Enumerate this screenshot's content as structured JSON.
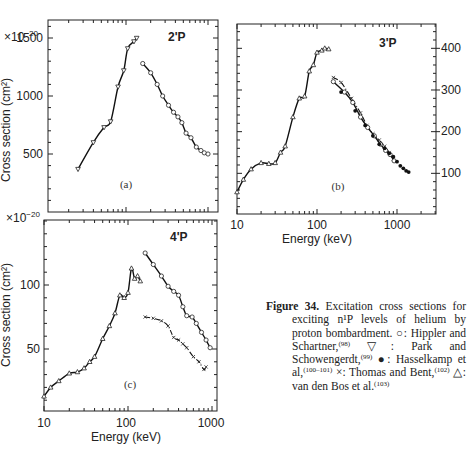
{
  "figure": {
    "caption_label": "Figure 34.",
    "caption_text": "Excitation cross sections for exciting n¹P levels of helium by proton bombardment.",
    "legend": [
      {
        "symbol": "○",
        "name": "open-circle",
        "text": "Hippler and Schartner,",
        "ref": "(98)"
      },
      {
        "symbol": "▽",
        "name": "down-triangle",
        "text": "Park and Schowengerdt,",
        "ref": "(99)"
      },
      {
        "symbol": "●",
        "name": "filled-circle",
        "text": "Hasselkamp et al,",
        "ref": "(100–101)"
      },
      {
        "symbol": "×",
        "name": "cross",
        "text": "Thomas and Bent,",
        "ref": "(102)"
      },
      {
        "symbol": "△",
        "name": "up-triangle",
        "text": "van den Bos et al.",
        "ref": "(103)"
      }
    ]
  },
  "chart_data": [
    {
      "type": "line",
      "panel": "(a)",
      "title": "2¹P",
      "xlabel": "",
      "ylabel": "Cross section (cm²)",
      "y_multiplier": "×10⁻²⁰",
      "xscale": "log",
      "xlim": [
        10,
        1000
      ],
      "ylim": [
        0,
        1650
      ],
      "yticks": [
        500,
        1000,
        1500
      ],
      "series": [
        {
          "name": "Park and Schowengerdt (▽)",
          "marker": "down-triangle",
          "line": "solid",
          "x": [
            26,
            40,
            54,
            65,
            80,
            94,
            105,
            125,
            135
          ],
          "y": [
            370,
            600,
            730,
            780,
            1080,
            1220,
            1410,
            1470,
            1500
          ]
        },
        {
          "name": "Hippler and Schartner (○)",
          "marker": "open-circle",
          "line": "solid",
          "x": [
            160,
            200,
            240,
            280,
            330,
            380,
            430,
            480,
            540,
            620,
            720,
            820,
            900,
            1000
          ],
          "y": [
            1280,
            1200,
            1100,
            1000,
            920,
            860,
            820,
            770,
            680,
            640,
            560,
            530,
            510,
            500
          ]
        }
      ]
    },
    {
      "type": "line",
      "panel": "(b)",
      "title": "3¹P",
      "xlabel": "Energy (keV)",
      "ylabel": "",
      "xscale": "log",
      "xlim": [
        10,
        3000
      ],
      "ylim": [
        0,
        450
      ],
      "xticks": [
        10,
        100,
        1000
      ],
      "yticks": [
        100,
        200,
        300,
        400
      ],
      "yaxis_position": "right",
      "series": [
        {
          "name": "van den Bos et al. (△) low-energy",
          "marker": "up-triangle",
          "line": "solid",
          "x": [
            10,
            12,
            15,
            20,
            25,
            30,
            35,
            40,
            50,
            60,
            70,
            80,
            90,
            100,
            115,
            125,
            140
          ],
          "y": [
            55,
            85,
            110,
            125,
            123,
            125,
            150,
            165,
            235,
            280,
            285,
            345,
            360,
            390,
            395,
            400,
            398
          ]
        },
        {
          "name": "Thomas and Bent (×)",
          "marker": "cross",
          "line": "dash-dot",
          "x": [
            160,
            200,
            270,
            350,
            420,
            500,
            600,
            700,
            800,
            900
          ],
          "y": [
            330,
            318,
            280,
            245,
            215,
            195,
            180,
            165,
            150,
            135
          ]
        },
        {
          "name": "Hippler and Schartner (○)",
          "marker": "open-circle",
          "line": "solid",
          "x": [
            160,
            220,
            280,
            350,
            430,
            520,
            620,
            720,
            820,
            920
          ],
          "y": [
            320,
            295,
            270,
            235,
            210,
            190,
            170,
            155,
            145,
            130
          ]
        },
        {
          "name": "Hasselkamp et al (●)",
          "marker": "filled-circle",
          "line": "none",
          "x": [
            200,
            300,
            400,
            500,
            600,
            700,
            800,
            900,
            1000,
            1100,
            1200,
            1300,
            1400
          ],
          "y": [
            295,
            250,
            215,
            190,
            170,
            160,
            148,
            140,
            128,
            118,
            112,
            106,
            103
          ]
        }
      ]
    },
    {
      "type": "line",
      "panel": "(c)",
      "title": "4¹P",
      "xlabel": "Energy (keV)",
      "ylabel": "Cross section (cm²)",
      "y_multiplier": "×10⁻²⁰",
      "xscale": "log",
      "xlim": [
        10,
        1000
      ],
      "ylim": [
        0,
        150
      ],
      "xticks": [
        10,
        100,
        1000
      ],
      "yticks": [
        50,
        100
      ],
      "series": [
        {
          "name": "van den Bos et al. (△)",
          "marker": "up-triangle",
          "line": "solid",
          "x": [
            10,
            12,
            15,
            20,
            25,
            30,
            35,
            40,
            50,
            60,
            70,
            80,
            90,
            100,
            110,
            120,
            130,
            140
          ],
          "y": [
            13,
            20,
            25,
            31,
            32,
            35,
            40,
            44,
            58,
            68,
            78,
            92,
            90,
            94,
            113,
            105,
            107,
            103
          ]
        },
        {
          "name": "Hippler and Schartner (○)",
          "marker": "open-circle",
          "line": "solid",
          "x": [
            160,
            200,
            250,
            300,
            350,
            400,
            450,
            500,
            580,
            650,
            750,
            850,
            950
          ],
          "y": [
            125,
            116,
            107,
            99,
            95,
            92,
            83,
            76,
            75,
            70,
            63,
            57,
            51
          ]
        },
        {
          "name": "Thomas and Bent (×)",
          "marker": "cross",
          "line": "dash-dot",
          "x": [
            160,
            200,
            250,
            300,
            350,
            400,
            450,
            500,
            600,
            700,
            800,
            850
          ],
          "y": [
            75,
            74,
            72,
            68,
            59,
            57,
            54,
            51,
            44,
            40,
            34,
            36
          ]
        }
      ]
    }
  ],
  "labels": {
    "a_ymult": "×10",
    "a_ymult_exp": "−20",
    "a_ytick_1500": "1500",
    "a_ytick_1000": "1000",
    "a_ytick_500": "500",
    "a_title": "2'P",
    "a_panel": "(a)",
    "a_ylabel": "Cross section (cm²)",
    "b_title": "3'P",
    "b_panel": "(b)",
    "b_ytick_400": "400",
    "b_ytick_300": "300",
    "b_ytick_200": "200",
    "b_ytick_100": "100",
    "b_xtick_10": "10",
    "b_xtick_100": "100",
    "b_xtick_1000": "1000",
    "b_xlabel": "Energy (keV)",
    "c_ymult": "×10",
    "c_ymult_exp": "−20",
    "c_title": "4'P",
    "c_panel": "(c)",
    "c_ytick_100": "100",
    "c_ytick_50": "50",
    "c_ylabel": "Cross section (cm²)",
    "c_xtick_10": "10",
    "c_xtick_100": "100",
    "c_xtick_1000": "1000",
    "c_xlabel": "Energy (keV)"
  }
}
